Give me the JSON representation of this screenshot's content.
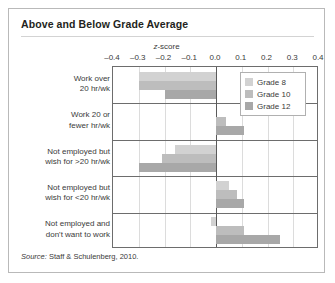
{
  "figure": {
    "title": "Above and Below Grade Average",
    "source_prefix": "Source:",
    "source_text": " Staff & Schulenberg, 2010."
  },
  "legend": {
    "items": [
      {
        "label": "Grade 8",
        "color": "#d2d2d2"
      },
      {
        "label": "Grade 10",
        "color": "#bdbdbd"
      },
      {
        "label": "Grade 12",
        "color": "#a8a8a8"
      }
    ]
  },
  "chart_data": {
    "type": "bar",
    "orientation": "horizontal",
    "title": "Above and Below Grade Average",
    "xlabel": "z-score",
    "ylabel": "",
    "xlim": [
      -0.4,
      0.4
    ],
    "xticks": [
      "-0.4",
      "-0.3",
      "-0.2",
      "-0.1",
      "0.0",
      "0.1",
      "0.2",
      "0.3",
      "0.4"
    ],
    "xtick_values": [
      -0.4,
      -0.3,
      -0.2,
      -0.1,
      0.0,
      0.1,
      0.2,
      0.3,
      0.4
    ],
    "grid": true,
    "legend_position": "top-right",
    "categories": [
      "Work over 20 hr/wk",
      "Work 20 or fewer hr/wk",
      "Not employed but wish for >20 hr/wk",
      "Not employed but wish for <20 hr/wk",
      "Not employed and don't want to work"
    ],
    "category_lines": [
      [
        "Work over",
        "20 hr/wk"
      ],
      [
        "Work 20 or",
        "fewer hr/wk"
      ],
      [
        "Not employed but",
        "wish for >20 hr/wk"
      ],
      [
        "Not employed but",
        "wish for <20 hr/wk"
      ],
      [
        "Not employed and",
        "don't want to work"
      ]
    ],
    "series": [
      {
        "name": "Grade 8",
        "color": "#d2d2d2",
        "values": [
          -0.3,
          0.0,
          -0.16,
          0.05,
          -0.02
        ]
      },
      {
        "name": "Grade 10",
        "color": "#bdbdbd",
        "values": [
          -0.3,
          0.04,
          -0.21,
          0.08,
          0.11
        ]
      },
      {
        "name": "Grade 12",
        "color": "#a8a8a8",
        "values": [
          -0.2,
          0.11,
          -0.3,
          0.11,
          0.25
        ]
      }
    ]
  }
}
